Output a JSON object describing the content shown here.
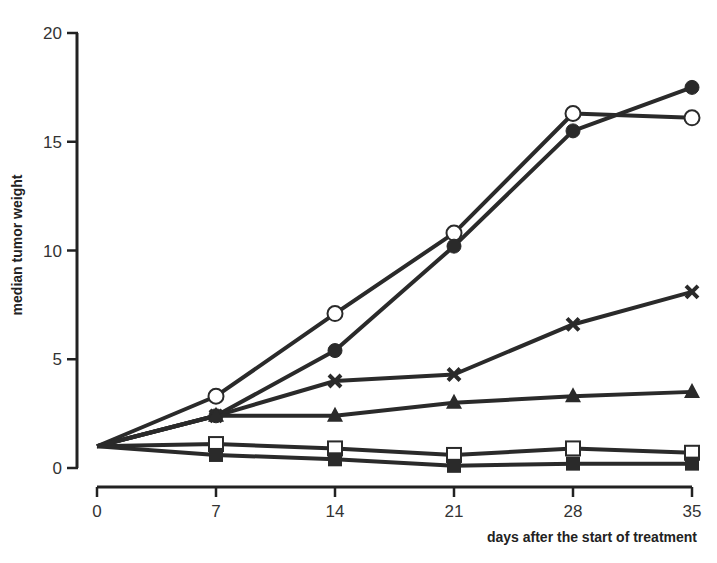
{
  "chart_data": {
    "type": "line",
    "title": "",
    "xlabel": "days after the start of treatment",
    "ylabel": "median tumor weight",
    "x": [
      0,
      7,
      14,
      21,
      28,
      35
    ],
    "xticks": [
      "0",
      "7",
      "14",
      "21",
      "28",
      "35"
    ],
    "yticks": [
      "0",
      "5",
      "10",
      "15",
      "20"
    ],
    "xlim": [
      0,
      35
    ],
    "ylim": [
      0,
      20
    ],
    "grid": false,
    "legend": "none",
    "series": [
      {
        "name": "open-circle",
        "marker": "open-circle",
        "values": [
          1.0,
          3.3,
          7.1,
          10.8,
          16.3,
          16.1
        ]
      },
      {
        "name": "filled-circle",
        "marker": "filled-circle",
        "values": [
          1.0,
          2.4,
          5.4,
          10.2,
          15.5,
          17.5
        ]
      },
      {
        "name": "cross",
        "marker": "x",
        "values": [
          1.0,
          2.4,
          4.0,
          4.3,
          6.6,
          8.1
        ]
      },
      {
        "name": "filled-triangle",
        "marker": "filled-triangle",
        "values": [
          1.0,
          2.4,
          2.4,
          3.0,
          3.3,
          3.5
        ]
      },
      {
        "name": "open-square",
        "marker": "open-square",
        "values": [
          1.0,
          1.1,
          0.9,
          0.6,
          0.9,
          0.7
        ]
      },
      {
        "name": "filled-square",
        "marker": "filled-square",
        "values": [
          1.0,
          0.6,
          0.4,
          0.1,
          0.2,
          0.2
        ]
      }
    ]
  },
  "colors": {
    "line": "#2a2a2a",
    "axis": "#222222",
    "text": "#333333",
    "background": "#ffffff"
  }
}
